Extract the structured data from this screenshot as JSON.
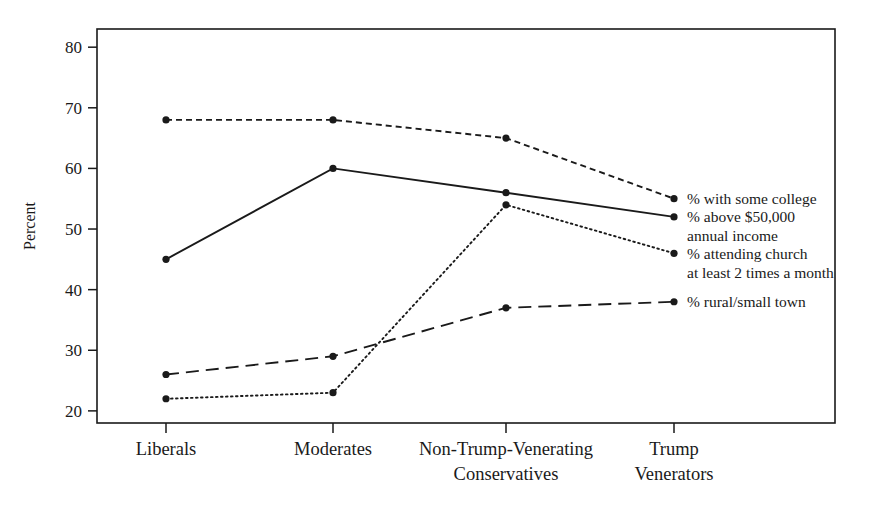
{
  "chart_data": {
    "type": "line",
    "title": "",
    "xlabel": "",
    "ylabel": "Percent",
    "ylim": [
      18,
      83
    ],
    "yticks": [
      20,
      30,
      40,
      50,
      60,
      70,
      80
    ],
    "ytick_labels": [
      "20",
      "30",
      "40",
      "50",
      "60",
      "70",
      "80"
    ],
    "grid": false,
    "legend_position": "right-inline",
    "categories": [
      "Liberals",
      "Moderates",
      "Non-Trump-Venerating Conservatives",
      "Trump Venerators"
    ],
    "category_label_lines": [
      [
        "Liberals"
      ],
      [
        "Moderates"
      ],
      [
        "Non-Trump-Venerating",
        "Conservatives"
      ],
      [
        "Trump",
        "Venerators"
      ]
    ],
    "series": [
      {
        "name": "% with some college",
        "label_lines": [
          "% with some college"
        ],
        "dash": "short-dash",
        "values": [
          68,
          68,
          65,
          55
        ]
      },
      {
        "name": "% above $50,000 annual income",
        "label_lines": [
          "% above $50,000",
          "annual income"
        ],
        "dash": "solid",
        "values": [
          45,
          60,
          56,
          52
        ]
      },
      {
        "name": "% attending church at least 2 times a month",
        "label_lines": [
          "% attending church",
          "at least 2 times a month"
        ],
        "dash": "dotted",
        "values": [
          22,
          23,
          54,
          46
        ]
      },
      {
        "name": "% rural/small town",
        "label_lines": [
          "% rural/small town"
        ],
        "dash": "long-dash",
        "values": [
          26,
          29,
          37,
          38
        ]
      }
    ]
  },
  "colors": {
    "ink": "#1a1a1a",
    "background": "#ffffff"
  }
}
